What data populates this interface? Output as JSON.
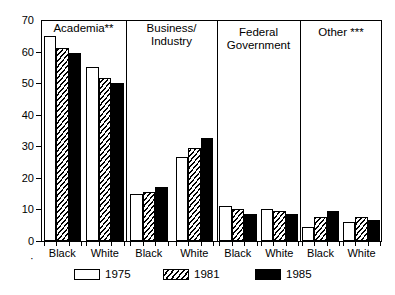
{
  "chart_data": {
    "type": "bar",
    "title": "",
    "xlabel": "",
    "ylabel": "",
    "ylim": [
      0,
      70
    ],
    "yticks": [
      0,
      10,
      20,
      30,
      40,
      50,
      60,
      70
    ],
    "grid": false,
    "legend_position": "bottom",
    "legend": [
      "1975",
      "1981",
      "1985"
    ],
    "series": [
      {
        "name": "1975",
        "style": "open-white"
      },
      {
        "name": "1981",
        "style": "hatched"
      },
      {
        "name": "1985",
        "style": "solid-black"
      }
    ],
    "panels": [
      {
        "label": "Academia**",
        "groups": [
          {
            "category": "Black",
            "values": [
              65.0,
              61.0,
              59.5
            ]
          },
          {
            "category": "White",
            "values": [
              55.0,
              51.5,
              50.0
            ]
          }
        ]
      },
      {
        "label": "Business/\nIndustry",
        "label_line1": "Business/",
        "label_line2": "Industry",
        "groups": [
          {
            "category": "Black",
            "values": [
              15.0,
              15.5,
              17.0
            ]
          },
          {
            "category": "White",
            "values": [
              26.5,
              29.5,
              32.5
            ]
          }
        ]
      },
      {
        "label": "Federal\nGovernment",
        "label_line1": "Federal",
        "label_line2": "Government",
        "groups": [
          {
            "category": "Black",
            "values": [
              11.0,
              10.0,
              8.5
            ]
          },
          {
            "category": "White",
            "values": [
              10.0,
              9.5,
              8.5
            ]
          }
        ]
      },
      {
        "label": "Other ***",
        "label_line1": "Other ***",
        "label_line2": "",
        "groups": [
          {
            "category": "Black",
            "values": [
              4.5,
              7.5,
              9.5
            ]
          },
          {
            "category": "White",
            "values": [
              6.0,
              7.5,
              6.5
            ]
          }
        ]
      }
    ]
  },
  "axis": {
    "y_tick_labels": [
      "70",
      "60",
      "50",
      "40",
      "30",
      "20",
      "10",
      "0"
    ]
  },
  "x_marker": "·"
}
